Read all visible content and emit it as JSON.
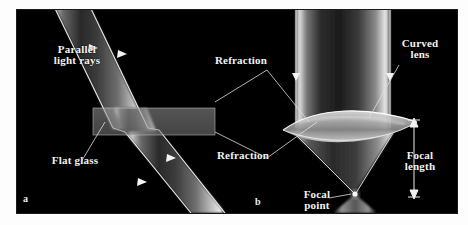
{
  "figure": {
    "background_color": "#ffffff",
    "panel_color": "#000000",
    "label_color": "#f2f2f2",
    "beam_color": "#e8e8e8"
  },
  "panels": [
    {
      "id": "a",
      "letter": "a",
      "caption": "Flat glass refraction"
    },
    {
      "id": "b",
      "letter": "b",
      "caption": "Curved lens refraction"
    }
  ],
  "labels": {
    "parallel_light_rays": "Parallel\nlight rays",
    "flat_glass": "Flat glass",
    "refraction_top": "Refraction",
    "refraction_bottom": "Refraction",
    "curved_lens": "Curved\nlens",
    "focal_length": "Focal\nlength",
    "focal_point": "Focal\npoint"
  },
  "annotations": {
    "letter_a": "a",
    "letter_b": "b"
  },
  "optics": {
    "left_beam_direction": "down-right",
    "right_beam_direction": "down",
    "arrowheads": 7,
    "focal_point_position": "below lens where rays converge"
  }
}
